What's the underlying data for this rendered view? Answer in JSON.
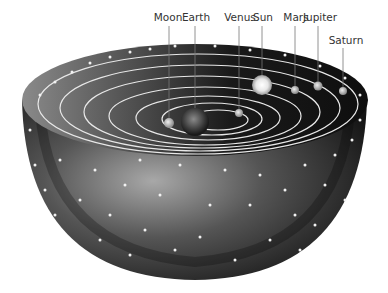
{
  "labels": [
    {
      "name": "Moon",
      "x": 168,
      "y": 20,
      "line_x": 169,
      "line_y2": 120,
      "body_y": 122
    },
    {
      "name": "Earth",
      "x": 196,
      "y": 20,
      "line_x": 195,
      "line_y2": 100,
      "body_y": 0
    },
    {
      "name": "Venus",
      "x": 240,
      "y": 20,
      "line_x": 239,
      "line_y2": 112,
      "body_y": 112
    },
    {
      "name": "Sun",
      "x": 263,
      "y": 20,
      "line_x": 262,
      "line_y2": 72,
      "body_y": 0
    },
    {
      "name": "Mars",
      "x": 296,
      "y": 20,
      "line_x": 295,
      "line_y2": 86,
      "body_y": 88
    },
    {
      "name": "Jupiter",
      "x": 320,
      "y": 20,
      "line_x": 318,
      "line_y2": 80,
      "body_y": 85
    },
    {
      "name": "Saturn",
      "x": 347,
      "y": 42,
      "line_x": 343,
      "line_y2": 85,
      "body_y": 90
    }
  ],
  "colors": {
    "sphere_dark": "#1a1a1a",
    "sphere_light": "#9a9a9a",
    "ring": "#e8e8e8",
    "star": "#f2f2f2",
    "label_text": "#333333"
  }
}
